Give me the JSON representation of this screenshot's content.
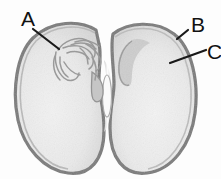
{
  "figure": {
    "name": "bean-seed-split-open",
    "background_color": "#fdfdfd",
    "width": 221,
    "height": 179
  },
  "labels": [
    {
      "id": "a",
      "text": "A",
      "refers_to": "embryo-plumule",
      "x": 21,
      "y": 8,
      "leader": {
        "x1": 33,
        "y1": 29,
        "x2": 59,
        "y2": 49
      }
    },
    {
      "id": "b",
      "text": "B",
      "refers_to": "seed-coat",
      "x": 191,
      "y": 14,
      "leader": {
        "x1": 188,
        "y1": 30,
        "x2": 177,
        "y2": 39
      }
    },
    {
      "id": "c",
      "text": "C",
      "refers_to": "cotyledon",
      "x": 207,
      "y": 41,
      "leader": {
        "x1": 206,
        "y1": 50,
        "x2": 170,
        "y2": 63
      }
    }
  ],
  "colors": {
    "outline": "#7d7d7d",
    "outline_dark": "#6a6a6a",
    "cotyledon_fill": "#ececec",
    "cotyledon_fill_light": "#f4f4f4",
    "inner_shadow": "#bfbfbf",
    "embryo_stroke": "#9a9a9a",
    "label_text": "#111111",
    "leader_line": "#1a1a1a",
    "gap_highlight": "#fbfbfb"
  },
  "parts": [
    {
      "id": "left-cotyledon",
      "label": "Left cotyledon"
    },
    {
      "id": "right-cotyledon",
      "label": "Right cotyledon"
    },
    {
      "id": "embryo",
      "label": "Embryo with plumule"
    },
    {
      "id": "radicle",
      "label": "Radicle"
    },
    {
      "id": "hilum-gap",
      "label": "Central split gap"
    }
  ]
}
